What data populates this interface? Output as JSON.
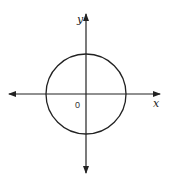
{
  "diagram": {
    "type": "coordinate-plane-circle",
    "x_axis_label": "x",
    "y_axis_label": "y",
    "origin_label": "0",
    "circle": {
      "center": [
        0,
        0
      ],
      "shape": "circle centered at origin"
    },
    "stroke_color": "#222222",
    "background": "#ffffff"
  }
}
